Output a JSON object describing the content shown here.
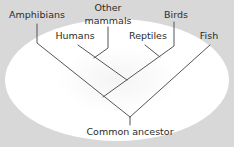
{
  "diagram": {
    "type": "phylogenetic-tree",
    "background_color": "#d8d8d8",
    "highlight_color": "#ffffff",
    "line_color": "#555555",
    "root": {
      "label": "Common ancestor"
    },
    "leaves": [
      {
        "id": "amphibians",
        "label": "Amphibians"
      },
      {
        "id": "other-mammals",
        "label_line1": "Other",
        "label_line2": "mammals"
      },
      {
        "id": "humans",
        "label": "Humans"
      },
      {
        "id": "reptiles",
        "label": "Reptiles"
      },
      {
        "id": "birds",
        "label": "Birds"
      },
      {
        "id": "fish",
        "label": "Fish"
      }
    ],
    "clades": [
      {
        "members": [
          "humans",
          "other-mammals"
        ]
      },
      {
        "members": [
          "reptiles",
          "birds"
        ]
      },
      {
        "members": [
          "humans",
          "other-mammals",
          "reptiles",
          "birds"
        ]
      },
      {
        "members": [
          "amphibians",
          "humans",
          "other-mammals",
          "reptiles",
          "birds"
        ]
      },
      {
        "members": [
          "amphibians",
          "humans",
          "other-mammals",
          "reptiles",
          "birds",
          "fish"
        ]
      }
    ]
  }
}
